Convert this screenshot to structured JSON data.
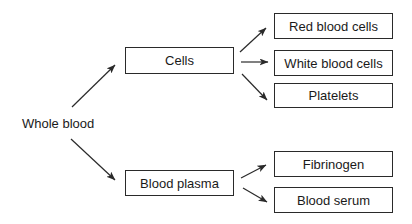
{
  "diagram": {
    "type": "tree",
    "direction": "left-to-right",
    "root": {
      "id": "whole-blood",
      "label": "Whole blood"
    },
    "nodes": [
      {
        "id": "cells",
        "label": "Cells",
        "parent": "whole-blood"
      },
      {
        "id": "red-blood-cells",
        "label": "Red blood cells",
        "parent": "cells"
      },
      {
        "id": "white-blood-cells",
        "label": "White blood cells",
        "parent": "cells"
      },
      {
        "id": "platelets",
        "label": "Platelets",
        "parent": "cells"
      },
      {
        "id": "blood-plasma",
        "label": "Blood plasma",
        "parent": "whole-blood"
      },
      {
        "id": "fibrinogen",
        "label": "Fibrinogen",
        "parent": "blood-plasma"
      },
      {
        "id": "blood-serum",
        "label": "Blood serum",
        "parent": "blood-plasma"
      }
    ],
    "edges": [
      {
        "from": "whole-blood",
        "to": "cells"
      },
      {
        "from": "whole-blood",
        "to": "blood-plasma"
      },
      {
        "from": "cells",
        "to": "red-blood-cells"
      },
      {
        "from": "cells",
        "to": "white-blood-cells"
      },
      {
        "from": "cells",
        "to": "platelets"
      },
      {
        "from": "blood-plasma",
        "to": "fibrinogen"
      },
      {
        "from": "blood-plasma",
        "to": "blood-serum"
      }
    ],
    "colors": {
      "line": "#2a2a2a",
      "text": "#1a1a1a",
      "background": "#ffffff"
    }
  }
}
